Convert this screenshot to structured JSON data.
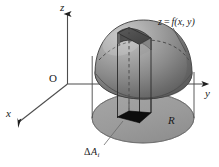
{
  "figure": {
    "background_color": "#ffffff",
    "axes": {
      "z_label": "z",
      "y_label": "y",
      "x_label": "x",
      "origin_label": "O",
      "axis_color": "#4d4d4d"
    },
    "surface": {
      "label_z": "z",
      "label_eq": "=",
      "label_f": "f",
      "label_args": "(x, y)",
      "label_full": "z = f(x, y)",
      "fill_light": "#b9b9b9",
      "fill_dark": "#6a6a6a",
      "outline_color": "#3d3d3d"
    },
    "region": {
      "label": "R",
      "fill": "#9d9d9d",
      "outline_color": "#4a4a4a"
    },
    "patch": {
      "label_delta": "Δ",
      "label_a": "A",
      "label_sub": "i",
      "label_full": "ΔA i",
      "fill": "#0d0d0d"
    },
    "column": {
      "line_color": "#3a3a3a",
      "top_fill": "#4e4e4e",
      "dashed_color": "#555555"
    }
  }
}
